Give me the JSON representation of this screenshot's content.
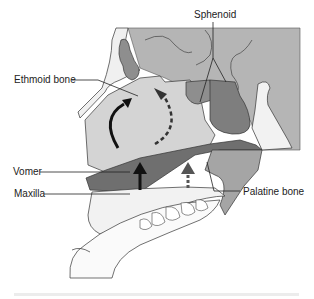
{
  "diagram": {
    "labels": {
      "sphenoid": "Sphenoid",
      "ethmoid": "Ethmoid bone",
      "vomer": "Vomer",
      "maxilla": "Maxilla",
      "palatine": "Palatine bone"
    },
    "arrows": [
      {
        "name": "curved-solid-arrow",
        "style": "solid",
        "color": "#111111"
      },
      {
        "name": "curved-dashed-arrow",
        "style": "dashed",
        "color": "#333333"
      },
      {
        "name": "upward-solid-arrow",
        "style": "solid",
        "color": "#111111"
      },
      {
        "name": "upward-dashed-arrow",
        "style": "dashed",
        "color": "#555555"
      }
    ],
    "colors": {
      "skull_gray": "#b5b5b5",
      "cavity_light": "#d4d4d4",
      "sinus_dark": "#8e8e8e",
      "palate_dark": "#6f6f6f",
      "bone_white": "#f4f4f4",
      "outline": "#333333"
    }
  }
}
